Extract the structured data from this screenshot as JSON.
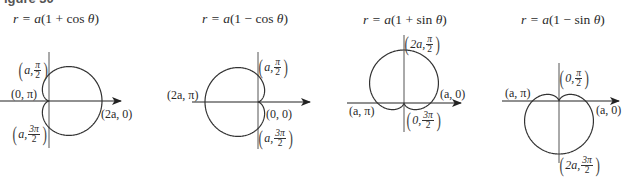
{
  "figure": {
    "label": "Figure 30",
    "scale_a_px": 26.5
  },
  "chart_data": [
    {
      "type": "line",
      "title": "r = a(1 + cos θ)",
      "equation": "r = a(1 + cos θ)",
      "curve": "cardioid",
      "orientation": "opens right (cusp at origin, pointing left)",
      "points": [
        {
          "label": "(a, π/2)",
          "r": "a",
          "theta": "π/2"
        },
        {
          "label": "(0, π)",
          "r": "0",
          "theta": "π"
        },
        {
          "label": "(a, 3π/2)",
          "r": "a",
          "theta": "3π/2"
        },
        {
          "label": "(2a, 0)",
          "r": "2a",
          "theta": "0"
        }
      ],
      "axes": {
        "polar_axis_arrow": true,
        "vertical_axis": true,
        "grid": false
      }
    },
    {
      "type": "line",
      "title": "r = a(1 − cos θ)",
      "equation": "r = a(1 − cos θ)",
      "curve": "cardioid",
      "orientation": "opens left (cusp at origin, pointing right)",
      "points": [
        {
          "label": "(a, π/2)",
          "r": "a",
          "theta": "π/2"
        },
        {
          "label": "(2a, π)",
          "r": "2a",
          "theta": "π"
        },
        {
          "label": "(0, 0)",
          "r": "0",
          "theta": "0"
        },
        {
          "label": "(a, 3π/2)",
          "r": "a",
          "theta": "3π/2"
        }
      ],
      "axes": {
        "polar_axis_arrow": true,
        "vertical_axis": true,
        "grid": false
      }
    },
    {
      "type": "line",
      "title": "r = a(1 + sin θ)",
      "equation": "r = a(1 + sin θ)",
      "curve": "cardioid",
      "orientation": "opens up (cusp at origin, pointing down)",
      "points": [
        {
          "label": "(2a, π/2)",
          "r": "2a",
          "theta": "π/2"
        },
        {
          "label": "(a, 0)",
          "r": "a",
          "theta": "0"
        },
        {
          "label": "(a, π)",
          "r": "a",
          "theta": "π"
        },
        {
          "label": "(0, 3π/2)",
          "r": "0",
          "theta": "3π/2"
        }
      ],
      "axes": {
        "polar_axis_arrow": true,
        "vertical_axis": true,
        "grid": false
      }
    },
    {
      "type": "line",
      "title": "r = a(1 − sin θ)",
      "equation": "r = a(1 − sin θ)",
      "curve": "cardioid",
      "orientation": "opens down (cusp at origin, pointing up)",
      "points": [
        {
          "label": "(0, π/2)",
          "r": "0",
          "theta": "π/2"
        },
        {
          "label": "(a, π)",
          "r": "a",
          "theta": "π"
        },
        {
          "label": "(a, 0)",
          "r": "a",
          "theta": "0"
        },
        {
          "label": "(2a, 3π/2)",
          "r": "2a",
          "theta": "3π/2"
        }
      ],
      "axes": {
        "polar_axis_arrow": true,
        "vertical_axis": true,
        "grid": false
      }
    }
  ],
  "panels": [
    {
      "title": {
        "pre": "r = ",
        "a": "a",
        "mid": "(1 + cos ",
        "theta": "θ",
        "post": ")"
      },
      "labels": {
        "l1": {
          "pre": "a, ",
          "num": "π",
          "den": "2"
        },
        "l2": "(0, π)",
        "l3": {
          "pre": "a, ",
          "num": "3π",
          "den": "2"
        },
        "l4": "(2a, 0)"
      }
    },
    {
      "title": {
        "pre": "r = ",
        "a": "a",
        "mid": "(1 − cos ",
        "theta": "θ",
        "post": ")"
      },
      "labels": {
        "l1": {
          "pre": "a, ",
          "num": "π",
          "den": "2"
        },
        "l2": "(2a, π)",
        "l3": "(0, 0)",
        "l4": {
          "pre": "a, ",
          "num": "3π",
          "den": "2"
        }
      }
    },
    {
      "title": {
        "pre": "r = ",
        "a": "a",
        "mid": "(1 + sin ",
        "theta": "θ",
        "post": ")"
      },
      "labels": {
        "l1": {
          "pre": "2a, ",
          "num": "π",
          "den": "2"
        },
        "l2": "(a, 0)",
        "l3": "(a, π)",
        "l4": {
          "pre": "0, ",
          "num": "3π",
          "den": "2"
        }
      }
    },
    {
      "title": {
        "pre": "r = ",
        "a": "a",
        "mid": "(1 − sin ",
        "theta": "θ",
        "post": ")"
      },
      "labels": {
        "l1": {
          "pre": "0, ",
          "num": "π",
          "den": "2"
        },
        "l2": "(a, π)",
        "l3": "(a, 0)",
        "l4": {
          "pre": "2a, ",
          "num": "3π",
          "den": "2"
        }
      }
    }
  ],
  "colors": {
    "ink": "#333333",
    "axis": "#555555",
    "background": "#ffffff"
  }
}
